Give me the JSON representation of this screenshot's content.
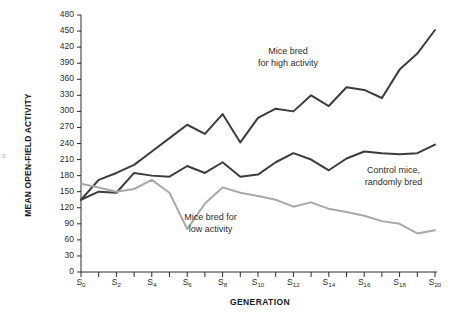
{
  "chart_data": {
    "type": "line",
    "title": "",
    "xlabel": "GENERATION",
    "ylabel": "MEAN OPEN-FIELD ACTIVITY",
    "ylim": [
      0,
      480
    ],
    "ytick_step": 30,
    "ytick_labels": [
      "480",
      "450",
      "420",
      "390",
      "360",
      "330",
      "300",
      "270",
      "240",
      "210",
      "180",
      "150",
      "120",
      "90",
      "60",
      "30",
      "0"
    ],
    "xtick_labels": [
      "S0",
      "S2",
      "S4",
      "S6",
      "S8",
      "S10",
      "S12",
      "S14",
      "S16",
      "S18",
      "S20"
    ],
    "xtick_bases": [
      "S",
      "S",
      "S",
      "S",
      "S",
      "S",
      "S",
      "S",
      "S",
      "S",
      "S"
    ],
    "xtick_subs": [
      "0",
      "2",
      "4",
      "6",
      "8",
      "10",
      "12",
      "14",
      "16",
      "18",
      "20"
    ],
    "x": [
      0,
      1,
      2,
      3,
      4,
      5,
      6,
      7,
      8,
      9,
      10,
      11,
      12,
      13,
      14,
      15,
      16,
      17,
      18,
      19,
      20
    ],
    "grid": false,
    "legend_position": "inline-annotations",
    "series": [
      {
        "name": "Mice bred for high activity",
        "color": "#3c3c3c",
        "values": [
          135,
          172,
          185,
          200,
          225,
          250,
          275,
          258,
          295,
          242,
          288,
          305,
          300,
          330,
          310,
          345,
          340,
          325,
          378,
          408,
          452
        ]
      },
      {
        "name": "Control mice, randomly bred",
        "color": "#3c3c3c",
        "values": [
          135,
          150,
          148,
          185,
          180,
          178,
          198,
          185,
          205,
          178,
          182,
          205,
          222,
          210,
          190,
          212,
          225,
          222,
          220,
          222,
          238
        ]
      },
      {
        "name": "Mice bred for low activity",
        "color": "#a8a8a8",
        "values": [
          165,
          158,
          150,
          155,
          172,
          148,
          80,
          128,
          158,
          148,
          142,
          135,
          122,
          130,
          118,
          112,
          105,
          95,
          90,
          72,
          78
        ]
      }
    ],
    "annotations": [
      {
        "id": "high",
        "line1": "Mice bred",
        "line2": "for high activity"
      },
      {
        "id": "control",
        "line1": "Control mice,",
        "line2": "randomly bred"
      },
      {
        "id": "low",
        "line1": "Mice bred for",
        "line2": "low activity"
      }
    ]
  },
  "colors": {
    "axis": "#2b2b2b",
    "high_line": "#3c3c3c",
    "control_line": "#3c3c3c",
    "low_line": "#a8a8a8",
    "text": "#2b2b2b",
    "background": "#ffffff"
  },
  "stray_marks": {
    "left_edge": "s"
  }
}
